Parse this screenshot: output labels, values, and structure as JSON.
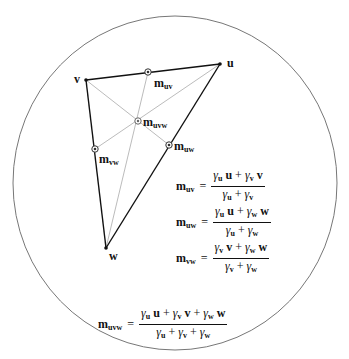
{
  "header": {
    "cut_title": "..."
  },
  "diagram": {
    "boundary": {
      "shape": "ellipse",
      "cx": 175,
      "cy": 183,
      "rx": 162,
      "ry": 167,
      "stroke": "#777777"
    },
    "vertices": [
      {
        "id": "u",
        "label": "u",
        "x": 220,
        "y": 64
      },
      {
        "id": "v",
        "label": "v",
        "x": 86,
        "y": 80
      },
      {
        "id": "w",
        "label": "w",
        "x": 106,
        "y": 248
      }
    ],
    "edge_color": "#111111",
    "cevian_color": "#aaaaaa",
    "points": [
      {
        "id": "m_uv",
        "base": "m",
        "sub": "uv",
        "x": 148,
        "y": 72
      },
      {
        "id": "m_uw",
        "base": "m",
        "sub": "uw",
        "x": 169,
        "y": 145
      },
      {
        "id": "m_vw",
        "base": "m",
        "sub": "vw",
        "x": 95,
        "y": 149
      },
      {
        "id": "m_uvw",
        "base": "m",
        "sub": "uvw",
        "x": 138,
        "y": 121
      }
    ]
  },
  "equations": [
    {
      "lhs_base": "m",
      "lhs_sub": "uv",
      "eq": "=",
      "num": [
        {
          "g": "γ",
          "s": "u",
          "v": "u"
        },
        {
          "op": "+"
        },
        {
          "g": "γ",
          "s": "v",
          "v": "v"
        }
      ],
      "den": [
        {
          "g": "γ",
          "s": "u"
        },
        {
          "op": "+"
        },
        {
          "g": "γ",
          "s": "v"
        }
      ]
    },
    {
      "lhs_base": "m",
      "lhs_sub": "uw",
      "eq": "=",
      "num": [
        {
          "g": "γ",
          "s": "u",
          "v": "u"
        },
        {
          "op": "+"
        },
        {
          "g": "γ",
          "s": "w",
          "v": "w"
        }
      ],
      "den": [
        {
          "g": "γ",
          "s": "u"
        },
        {
          "op": "+"
        },
        {
          "g": "γ",
          "s": "w"
        }
      ]
    },
    {
      "lhs_base": "m",
      "lhs_sub": "vw",
      "eq": "=",
      "num": [
        {
          "g": "γ",
          "s": "v",
          "v": "v"
        },
        {
          "op": "+"
        },
        {
          "g": "γ",
          "s": "w",
          "v": "w"
        }
      ],
      "den": [
        {
          "g": "γ",
          "s": "v"
        },
        {
          "op": "+"
        },
        {
          "g": "γ",
          "s": "w"
        }
      ]
    },
    {
      "lhs_base": "m",
      "lhs_sub": "uvw",
      "eq": "=",
      "num": [
        {
          "g": "γ",
          "s": "u",
          "v": "u"
        },
        {
          "op": "+"
        },
        {
          "g": "γ",
          "s": "v",
          "v": "v"
        },
        {
          "op": "+"
        },
        {
          "g": "γ",
          "s": "w",
          "v": "w"
        }
      ],
      "den": [
        {
          "g": "γ",
          "s": "u"
        },
        {
          "op": "+"
        },
        {
          "g": "γ",
          "s": "v"
        },
        {
          "op": "+"
        },
        {
          "g": "γ",
          "s": "w"
        }
      ]
    }
  ]
}
